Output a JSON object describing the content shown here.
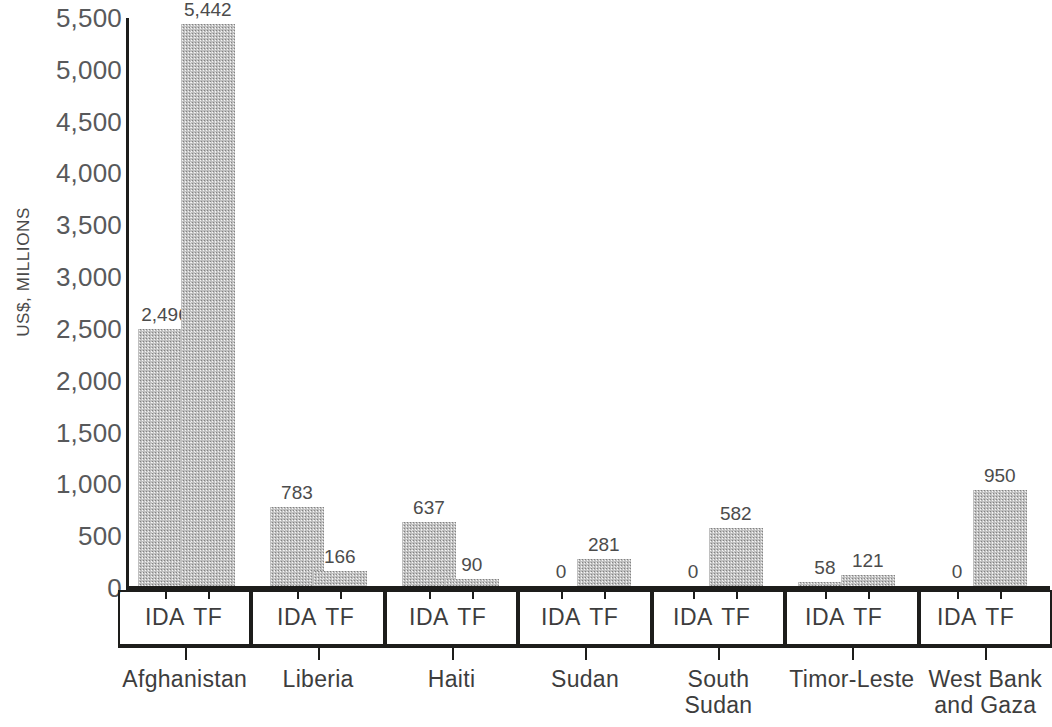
{
  "chart_data": {
    "type": "bar",
    "title": "",
    "xlabel": "",
    "ylabel": "US$, MILLIONS",
    "ylim": [
      0,
      5500
    ],
    "ytick_step": 500,
    "ytick_labels": [
      "5,500",
      "5,000",
      "4,500",
      "4,000",
      "3,500",
      "3,000",
      "2,500",
      "2,000",
      "1,500",
      "1,000",
      "500",
      "0"
    ],
    "ytick_values": [
      5500,
      5000,
      4500,
      4000,
      3500,
      3000,
      2500,
      2000,
      1500,
      1000,
      500,
      0
    ],
    "grid": false,
    "legend_position": "none",
    "categories": [
      "Afghanistan",
      "Liberia",
      "Haiti",
      "Sudan",
      "South Sudan",
      "Timor-Leste",
      "West Bank and Gaza"
    ],
    "category_lines": [
      [
        "Afghanistan"
      ],
      [
        "Liberia"
      ],
      [
        "Haiti"
      ],
      [
        "Sudan"
      ],
      [
        "South",
        "Sudan"
      ],
      [
        "Timor-Leste"
      ],
      [
        "West Bank",
        "and Gaza"
      ]
    ],
    "subcategories": [
      "IDA",
      "TF"
    ],
    "series": [
      {
        "name": "IDA",
        "values": [
          2496,
          783,
          637,
          0,
          0,
          58,
          0
        ]
      },
      {
        "name": "TF",
        "values": [
          5442,
          166,
          90,
          281,
          582,
          121,
          950
        ]
      }
    ],
    "value_labels": [
      {
        "category": "Afghanistan",
        "sub": "IDA",
        "text": "2,496"
      },
      {
        "category": "Afghanistan",
        "sub": "TF",
        "text": "5,442"
      },
      {
        "category": "Liberia",
        "sub": "IDA",
        "text": "783"
      },
      {
        "category": "Liberia",
        "sub": "TF",
        "text": "166"
      },
      {
        "category": "Haiti",
        "sub": "IDA",
        "text": "637"
      },
      {
        "category": "Haiti",
        "sub": "TF",
        "text": "90"
      },
      {
        "category": "Sudan",
        "sub": "IDA",
        "text": "0"
      },
      {
        "category": "Sudan",
        "sub": "TF",
        "text": "281"
      },
      {
        "category": "South Sudan",
        "sub": "IDA",
        "text": "0"
      },
      {
        "category": "South Sudan",
        "sub": "TF",
        "text": "582"
      },
      {
        "category": "Timor-Leste",
        "sub": "IDA",
        "text": "58"
      },
      {
        "category": "Timor-Leste",
        "sub": "TF",
        "text": "121"
      },
      {
        "category": "West Bank and Gaza",
        "sub": "IDA",
        "text": "0"
      },
      {
        "category": "West Bank and Gaza",
        "sub": "TF",
        "text": "950"
      }
    ],
    "bar_color": "#c0c0c0",
    "axis_color": "#1d1d1b",
    "text_color": "#4a4a4a"
  }
}
